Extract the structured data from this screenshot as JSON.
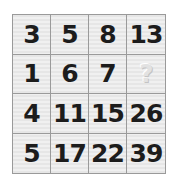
{
  "puzzle": {
    "rows": [
      [
        "3",
        "5",
        "8",
        "13"
      ],
      [
        "1",
        "6",
        "7",
        "?"
      ],
      [
        "4",
        "11",
        "15",
        "26"
      ],
      [
        "5",
        "17",
        "22",
        "39"
      ]
    ],
    "unknown_cell": {
      "row": 1,
      "col": 3,
      "glyph": "?"
    }
  },
  "colors": {
    "cell_background": "#e8e8e8",
    "grid_line": "#9a9a9a",
    "number_text": "#1c1c1c",
    "question_mark": "#e2e2e2"
  }
}
